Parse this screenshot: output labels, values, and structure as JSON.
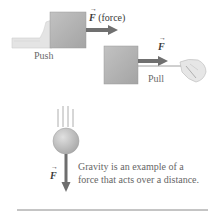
{
  "figure": {
    "push_panel": {
      "force_symbol": "F",
      "force_label": "(force)",
      "label": "Push"
    },
    "pull_panel": {
      "force_symbol": "F",
      "label": "Pull"
    },
    "gravity_panel": {
      "force_symbol": "F",
      "caption_line1": "Gravity is an example of a",
      "caption_line2": "force that acts over a distance."
    },
    "colors": {
      "box_fill": "#b0b0b0",
      "arrow": "#6b6b6b",
      "sphere": "#c4c4c4",
      "rule": "#8a8a8a",
      "hand": "#e2e2e2"
    }
  }
}
